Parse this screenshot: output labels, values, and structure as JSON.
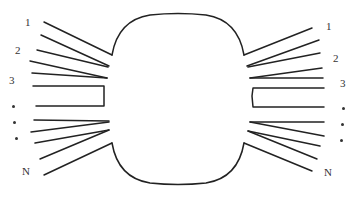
{
  "diagram": {
    "type": "multi-port device schematic",
    "stroke_color": "#222222",
    "left_labels": {
      "port1": "1",
      "port2": "2",
      "port3": "3",
      "portN": "N"
    },
    "right_labels": {
      "port1": "1",
      "port2": "2",
      "port3": "3",
      "portN": "N"
    },
    "ellipsis": "• • •"
  }
}
